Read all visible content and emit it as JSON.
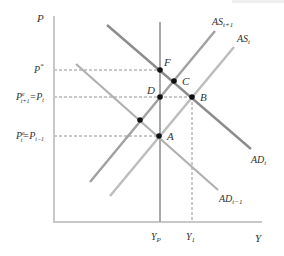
{
  "diagram": {
    "type": "AD-AS model",
    "axes": {
      "y_label": "P",
      "x_label": "Y",
      "x_ticks": [
        {
          "id": "yp",
          "main": "Y",
          "sub": "P"
        },
        {
          "id": "y1",
          "main": "Y",
          "sub": "1"
        }
      ],
      "y_ticks": [
        {
          "id": "pstar",
          "main": "P",
          "sup": "*"
        },
        {
          "id": "pe_t1",
          "main": "P",
          "sup": "e",
          "sub": "t+1",
          "eq": "=",
          "main2": "P",
          "sub2": "t"
        },
        {
          "id": "pe_t",
          "main": "P",
          "sup": "e",
          "sub": "t",
          "eq": "=",
          "main2": "P",
          "sub2": "t−1"
        }
      ]
    },
    "curves": [
      {
        "id": "as_t1",
        "main": "AS",
        "sub": "t+1"
      },
      {
        "id": "as_t",
        "main": "AS",
        "sub": "t"
      },
      {
        "id": "ad_t",
        "main": "AD",
        "sub": "t"
      },
      {
        "id": "ad_t_1",
        "main": "AD",
        "sub": "t−1"
      }
    ],
    "points": [
      {
        "id": "F",
        "label": "F"
      },
      {
        "id": "C",
        "label": "C"
      },
      {
        "id": "D",
        "label": "D"
      },
      {
        "id": "B",
        "label": "B"
      },
      {
        "id": "A",
        "label": "A"
      },
      {
        "id": "unlabeled",
        "label": ""
      }
    ],
    "colors": {
      "axis": "#c8c8c8",
      "curve_dark": "#8c8c8c",
      "curve_light": "#b4b4b4",
      "dashed": "#777777",
      "point": "#111111",
      "text": "#333333"
    }
  }
}
